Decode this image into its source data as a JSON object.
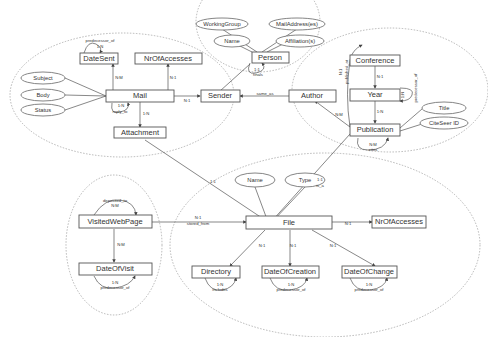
{
  "entities": {
    "mail": "Mail",
    "date_sent": "DateSent",
    "nr_of_accesses_mail": "NrOfAccesses",
    "attachment": "Attachment",
    "sender": "Sender",
    "person": "Person",
    "author": "Author",
    "conference": "Conference",
    "year": "Year",
    "publication": "Publication",
    "file": "File",
    "nr_of_accesses_file": "NrOfAccesses",
    "visited_web_page": "VisitedWebPage",
    "date_of_visit": "DateOfVisit",
    "directory": "Directory",
    "date_of_creation": "DateOfCreation",
    "date_of_change": "DateOfChange"
  },
  "attributes": {
    "subject": "Subject",
    "body": "Body",
    "status": "Status",
    "working_group": "WorkingGroup",
    "mail_addresses": "MailAddress(es)",
    "name_person": "Name",
    "affiliations": "Affiliation(s)",
    "title": "Title",
    "citeseer_id": "CiteSeer ID",
    "name_file": "Name",
    "type": "Type"
  },
  "relationships": {
    "datesent_predecessor_name": "predecessor_of",
    "datesent_predecessor_card": "1:N",
    "mail_datesent_card": "N:M",
    "mail_nracc_card": "N:1",
    "mail_reply_card": "1:N",
    "mail_reply_name": "reply_to",
    "mail_attachment_card": "1:N",
    "mail_sender_card": "N:1",
    "person_finals_card": "1:1",
    "person_finals_name": "finals",
    "author_sender_name": "same_as",
    "author_conference_card": "N:1",
    "author_conference_name": "published_at",
    "conference_year_card": "N:1",
    "year_predecessor_card": "1:N",
    "year_predecessor_name": "predecessor_of",
    "year_publication_card": "1:N",
    "publication_author_card": "N:M",
    "publication_cites_card": "N:M",
    "publication_cites_name": "cites",
    "publication_file_card": "1:1",
    "publication_file_name": "is_a",
    "attachment_file_card": "1:1",
    "visited_stored_card": "N:1",
    "visited_stored_name": "stored_from",
    "visited_deposited_name": "deposited_to",
    "visited_deposited_card": "N:M",
    "visited_datevisit_card": "N:M",
    "datevisit_predecessor_card": "1:N",
    "datevisit_predecessor_name": "predecessor_of",
    "file_nracc_card": "N:1",
    "file_directory_card": "N:1",
    "file_creation_card": "N:1",
    "file_change_card": "N:1",
    "directory_includes_card": "1:N",
    "directory_includes_name": "includes",
    "creation_predecessor_card": "1:N",
    "creation_predecessor_name": "predecessor_of",
    "change_predecessor_card": "1:N",
    "change_predecessor_name": "predecessor_of"
  }
}
